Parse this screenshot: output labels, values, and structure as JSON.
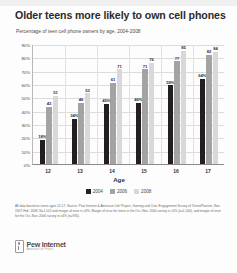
{
  "chart_data": {
    "type": "bar",
    "title": "Older teens more likely to own cell phones",
    "subtitle": "Percentage of teen cell phone owners by age, 2004-2008",
    "xlabel": "Age",
    "ylabel": "",
    "categories": [
      "12",
      "13",
      "14",
      "15",
      "16",
      "17"
    ],
    "ylim": [
      0,
      90
    ],
    "yticks": [
      "90%",
      "80%",
      "70%",
      "60%",
      "50%",
      "40%",
      "30%",
      "20%",
      "10%",
      "0%"
    ],
    "ytick_values": [
      90,
      80,
      70,
      60,
      50,
      40,
      30,
      20,
      10,
      0
    ],
    "grid": true,
    "legend_position": "bottom",
    "series": [
      {
        "name": "2004",
        "color": "#231f20",
        "values": [
          18,
          34,
          45,
          46,
          59,
          64
        ],
        "labels": [
          "18%",
          "34%",
          "45%",
          "46%",
          "59%",
          "64%"
        ]
      },
      {
        "name": "2006",
        "color": "#a3a3a3",
        "values": [
          43,
          46,
          61,
          71,
          77,
          82
        ],
        "labels": [
          "43",
          "46",
          "61",
          "71",
          "77",
          "82"
        ]
      },
      {
        "name": "2008",
        "color": "#d8d8d8",
        "values": [
          51,
          53,
          71,
          76,
          85,
          84
        ],
        "labels": [
          "51",
          "53",
          "71",
          "76",
          "85",
          "84"
        ]
      }
    ]
  },
  "footnote": "All data based on teens ages 12-17. Source: Pew Internet & American Life Project, Gaming and Civic Engagement Survey of Teens/Parents, Nov. 2007-Feb. 2008, N=1,102 and margin of error is ±3%. Margin of error for teens in the Oct.-Nov. 2004 survey is ±5% (n=1,100), and margin of error for the Oct.-Nov. 2006 survey is ±4% (n=935).",
  "logo": {
    "name": "Pew Internet",
    "tagline": "American Life Project"
  }
}
